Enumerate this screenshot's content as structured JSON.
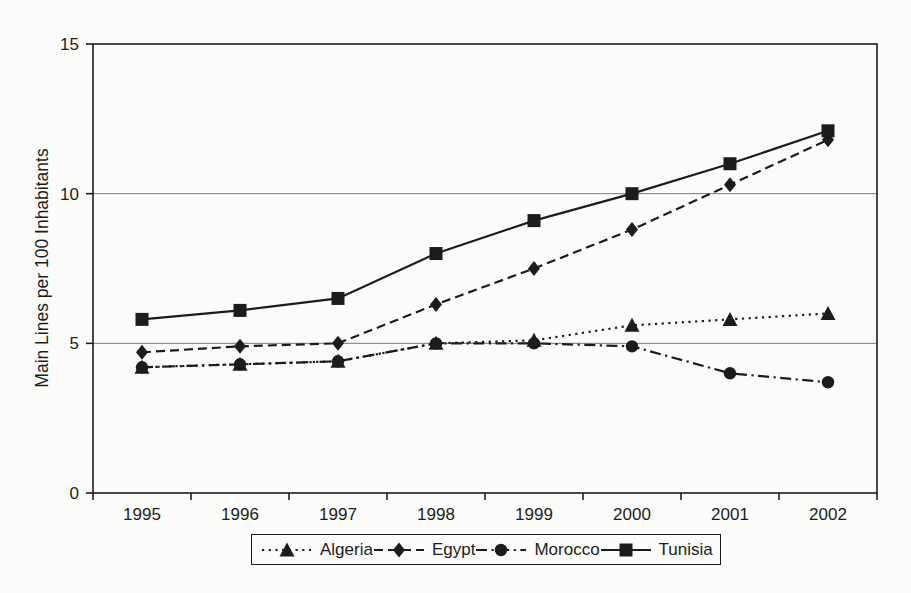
{
  "figure": {
    "ink_color": "#1c1c1c",
    "gridline_color": "#787878",
    "background_color": "#fcfcfa"
  },
  "chart_data": {
    "type": "line",
    "title": "",
    "xlabel": "",
    "ylabel": "Main Lines per 100 Inhabitants",
    "categories": [
      "1995",
      "1996",
      "1997",
      "1998",
      "1999",
      "2000",
      "2001",
      "2002"
    ],
    "ylim": [
      0,
      15
    ],
    "yticks": [
      0,
      5,
      10,
      15
    ],
    "grid": "horizontal",
    "legend_position": "bottom",
    "series": [
      {
        "name": "Algeria",
        "line": "dotted",
        "marker": "triangle",
        "values": [
          4.2,
          4.3,
          4.4,
          5.0,
          5.1,
          5.6,
          5.8,
          6.0
        ]
      },
      {
        "name": "Egypt",
        "line": "dashed",
        "marker": "diamond",
        "values": [
          4.7,
          4.9,
          5.0,
          6.3,
          7.5,
          8.8,
          10.3,
          11.8
        ]
      },
      {
        "name": "Morocco",
        "line": "dashdot",
        "marker": "circle",
        "values": [
          4.2,
          4.3,
          4.4,
          5.0,
          5.0,
          4.9,
          4.0,
          3.7
        ]
      },
      {
        "name": "Tunisia",
        "line": "solid",
        "marker": "square",
        "values": [
          5.8,
          6.1,
          6.5,
          8.0,
          9.1,
          10.0,
          11.0,
          12.1
        ]
      }
    ]
  }
}
